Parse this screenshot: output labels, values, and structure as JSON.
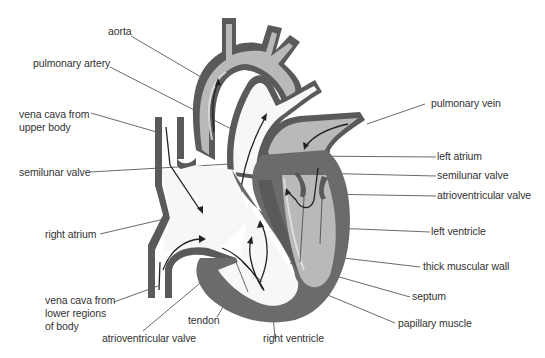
{
  "figure": {
    "colors": {
      "outline": "#5a5a5a",
      "oxygenated_blood": "#b9b9b9",
      "deoxygenated_blood": "#f7f7f7",
      "muscle": "#6b6b6b",
      "label_text": "#333333",
      "leader_line": "#444444"
    }
  },
  "labels": [
    {
      "id": "aorta",
      "text": "aorta"
    },
    {
      "id": "pulmonary-artery",
      "text": "pulmonary artery"
    },
    {
      "id": "vena-cava-upper",
      "text": "vena cava from\nupper body"
    },
    {
      "id": "semilunar-valve-right",
      "text": "semilunar valve"
    },
    {
      "id": "right-atrium",
      "text": "right atrium"
    },
    {
      "id": "vena-cava-lower",
      "text": "vena cava from\nlower regions\nof body"
    },
    {
      "id": "atrioventricular-valve-right",
      "text": "atrioventricular valve"
    },
    {
      "id": "tendon",
      "text": "tendon"
    },
    {
      "id": "right-ventricle",
      "text": "right ventricle"
    },
    {
      "id": "pulmonary-vein",
      "text": "pulmonary vein"
    },
    {
      "id": "left-atrium",
      "text": "left atrium"
    },
    {
      "id": "semilunar-valve-left",
      "text": "semilunar valve"
    },
    {
      "id": "atrioventricular-valve-left",
      "text": "atrioventricular valve"
    },
    {
      "id": "left-ventricle",
      "text": "left ventricle"
    },
    {
      "id": "thick-muscular-wall",
      "text": "thick muscular wall"
    },
    {
      "id": "septum",
      "text": "septum"
    },
    {
      "id": "papillary-muscle",
      "text": "papillary muscle"
    }
  ]
}
